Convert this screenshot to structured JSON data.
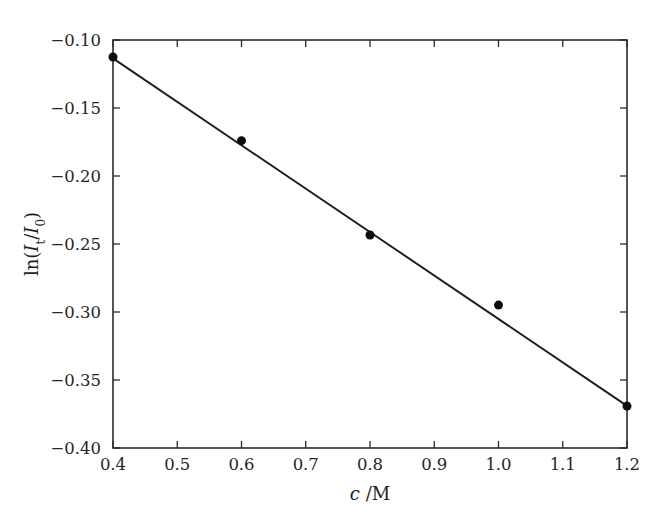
{
  "figure": {
    "background_color": "#ffffff",
    "foreground_color": "#1d1d1d",
    "width": 664,
    "height": 526
  },
  "chart_data": {
    "type": "scatter",
    "title": "",
    "subtitle": "",
    "xlabel": "c /M",
    "ylabel": "ln(It/I0)",
    "xlabel_parts": {
      "symbol": "c",
      "separator": " /",
      "unit": "M"
    },
    "ylabel_parts": {
      "prefix": "ln(",
      "numerator_symbol": "I",
      "numerator_sub": "t",
      "slash": "/",
      "denominator_symbol": "I",
      "denominator_sub": "0",
      "suffix": ")"
    },
    "xlim": [
      0.4,
      1.2
    ],
    "ylim": [
      -0.4,
      -0.1
    ],
    "xticks": [
      0.4,
      0.5,
      0.6,
      0.7,
      0.8,
      0.9,
      1.0,
      1.1,
      1.2
    ],
    "yticks": [
      -0.1,
      -0.15,
      -0.2,
      -0.25,
      -0.3,
      -0.35,
      -0.4
    ],
    "xticklabels": [
      "0.4",
      "0.5",
      "0.6",
      "0.7",
      "0.8",
      "0.9",
      "1.0",
      "1.1",
      "1.2"
    ],
    "yticklabels": [
      "-0.10",
      "-0.15",
      "-0.20",
      "-0.25",
      "-0.30",
      "-0.35",
      "-0.40"
    ],
    "tick_direction": "in",
    "grid": false,
    "legend": null,
    "frame": "box",
    "x": [
      0.4,
      0.6,
      0.8,
      1.0,
      1.2
    ],
    "values": [
      -0.1125,
      -0.174,
      -0.2434,
      -0.2949,
      -0.3692
    ],
    "series": [
      {
        "name": "measured",
        "marker": "filled-circle",
        "marker_size_px": 9,
        "color": "#0d0d0d",
        "x": [
          0.4,
          0.6,
          0.8,
          1.0,
          1.2
        ],
        "values": [
          -0.1125,
          -0.174,
          -0.2434,
          -0.2949,
          -0.3692
        ]
      },
      {
        "name": "linear-fit",
        "type": "line",
        "color": "#1d1d1d",
        "x": [
          0.4,
          1.2
        ],
        "values": [
          -0.1135,
          -0.369
        ],
        "slope": -0.3194,
        "intercept": 0.0143
      }
    ]
  }
}
